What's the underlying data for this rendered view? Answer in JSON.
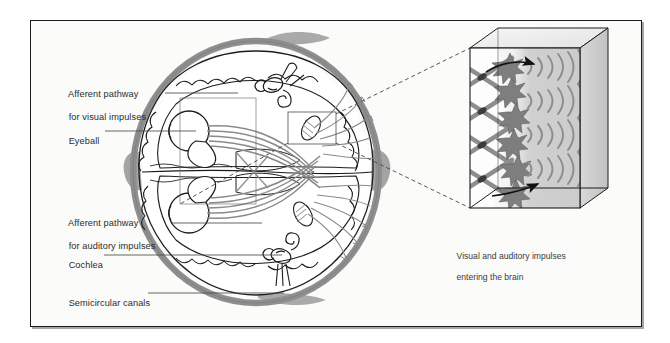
{
  "figure": {
    "type": "anatomical-diagram",
    "frame": {
      "x": 30,
      "y": 20,
      "width": 610,
      "height": 305,
      "fill": "#fbfbfa",
      "stroke": "#1a1a1a"
    }
  },
  "labels": [
    {
      "id": "afferent-visual",
      "line1": "Afferent pathway",
      "line2": "for visual impulses",
      "x": 58,
      "y": 78,
      "leader": {
        "x1": 165,
        "y1": 93,
        "x2": 238,
        "y2": 93
      }
    },
    {
      "id": "eyeball",
      "line1": "Eyeball",
      "line2": "",
      "x": 58,
      "y": 126,
      "leader": {
        "x1": 105,
        "y1": 131,
        "x2": 196,
        "y2": 131
      }
    },
    {
      "id": "afferent-auditory",
      "line1": "Afferent pathway",
      "line2": "for auditory impulses",
      "x": 58,
      "y": 207,
      "leader": {
        "x1": 172,
        "y1": 223,
        "x2": 262,
        "y2": 223
      }
    },
    {
      "id": "cochlea",
      "line1": "Cochlea",
      "line2": "",
      "x": 58,
      "y": 250,
      "leader": {
        "x1": 104,
        "y1": 255,
        "x2": 282,
        "y2": 255
      }
    },
    {
      "id": "semicircular-canals",
      "line1": "Semicircular canals",
      "line2": "",
      "x": 58,
      "y": 288,
      "leader": {
        "x1": 148,
        "y1": 293,
        "x2": 284,
        "y2": 293
      }
    }
  ],
  "caption": {
    "line1": "Visual and auditory impulses",
    "line2": "entering the brain",
    "x": 447,
    "y": 240
  },
  "inset": {
    "name": "magnified-3d-block",
    "front_face": {
      "x": 470,
      "y": 48,
      "width": 110,
      "height": 160
    },
    "depth_x": 28,
    "depth_y": -20,
    "arrows": [
      {
        "id": "arrow-top",
        "label": "incoming impulse direction (upper)"
      },
      {
        "id": "arrow-bottom",
        "label": "incoming impulse direction (lower)"
      }
    ],
    "neuron_rows": 6,
    "fiber_crossings": 5
  },
  "callout": {
    "source_box": {
      "x": 288,
      "y": 112,
      "width": 48,
      "height": 32
    },
    "brain_box": {
      "x": 180,
      "y": 98,
      "width": 76,
      "height": 106
    }
  },
  "colors": {
    "skull": "#8e8e8e",
    "brain_outline": "#1c1c1c",
    "nerve_fiber": "#8a8a8a",
    "nerve_fiber_dark": "#4a4a4a",
    "inset_shade": "#cfcfcf",
    "inset_shade_light": "#e6e6e6",
    "text": "#2b2b2b",
    "background": "#fbfbfa",
    "page": "#ffffff"
  }
}
